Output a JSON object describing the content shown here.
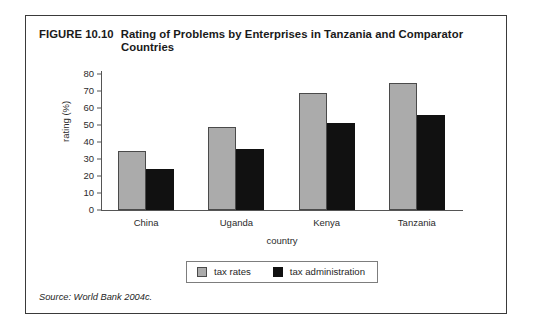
{
  "figure": {
    "number": "FIGURE 10.10",
    "title": "Rating of Problems by Enterprises in Tanzania and Comparator",
    "title_line2": "Countries",
    "source": "Source: World Bank 2004c."
  },
  "legend": {
    "items": [
      {
        "label": "tax rates",
        "color": "#ababab",
        "swatch_name": "legend-swatch-tax-rates"
      },
      {
        "label": "tax administration",
        "color": "#111111",
        "swatch_name": "legend-swatch-tax-administration"
      }
    ]
  },
  "chart_data": {
    "type": "bar",
    "title": "Rating of Problems by Enterprises in Tanzania and Comparator Countries",
    "xlabel": "country",
    "ylabel": "rating (%)",
    "ylim": [
      0,
      80
    ],
    "ytick_step": 10,
    "yticks": [
      0,
      10,
      20,
      30,
      40,
      50,
      60,
      70,
      80
    ],
    "ytick_labels": [
      "0",
      "10",
      "20",
      "30",
      "40",
      "50",
      "60",
      "70",
      "80"
    ],
    "grid": false,
    "legend_position": "bottom-center",
    "categories": [
      "China",
      "Uganda",
      "Kenya",
      "Tanzania"
    ],
    "series": [
      {
        "name": "tax rates",
        "color": "#ababab",
        "values": [
          35,
          49,
          69,
          75
        ]
      },
      {
        "name": "tax administration",
        "color": "#111111",
        "values": [
          24,
          36,
          51,
          56
        ]
      }
    ]
  }
}
